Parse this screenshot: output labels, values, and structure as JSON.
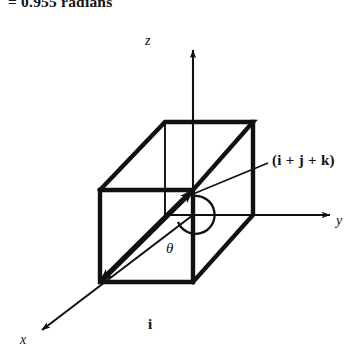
{
  "caption": {
    "text": "= 0.955 radians"
  },
  "figure": {
    "colors": {
      "ink": "#111111",
      "background": "#ffffff"
    },
    "axes": [
      {
        "name": "z-axis",
        "label": "z",
        "direction": "up"
      },
      {
        "name": "y-axis",
        "label": "y",
        "direction": "right"
      },
      {
        "name": "x-axis",
        "label": "x",
        "direction": "down-left"
      }
    ],
    "labels": {
      "z": "z",
      "y": "y",
      "x": "x",
      "theta": "θ",
      "vector": "(i + j + k)",
      "basis_i": "i"
    },
    "cube": {
      "name": "unit-cube",
      "front_face": [
        [
          100,
          190
        ],
        [
          193,
          190
        ],
        [
          193,
          282
        ],
        [
          100,
          282
        ]
      ],
      "back_face": [
        [
          165,
          122
        ],
        [
          253,
          122
        ],
        [
          253,
          215
        ],
        [
          165,
          215
        ]
      ]
    },
    "vector": {
      "name": "diagonal-vector",
      "from": [
        100,
        282
      ],
      "to": [
        193,
        190
      ],
      "label": "(i + j + k)",
      "arrowheads": "both"
    },
    "angle_arc": {
      "name": "theta-arc",
      "center": [
        193,
        215
      ],
      "label": "θ"
    }
  }
}
